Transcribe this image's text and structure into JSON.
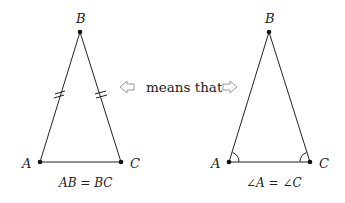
{
  "left_triangle": {
    "vertices": {
      "A": "A",
      "B": "B",
      "C": "C"
    },
    "caption": "AB = BC",
    "marks": "double tick marks on AB and BC"
  },
  "connector": {
    "text": "means that",
    "left_arrow_icon": "hollow-arrow-left",
    "right_arrow_icon": "hollow-arrow-right"
  },
  "right_triangle": {
    "vertices": {
      "A": "A",
      "B": "B",
      "C": "C"
    },
    "caption": "∠A = ∠C",
    "marks": "angle arcs at A and C"
  },
  "colors": {
    "stroke": "#222222",
    "arrow": "#999999"
  }
}
